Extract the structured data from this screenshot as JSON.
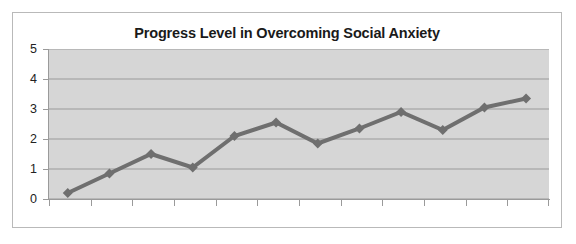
{
  "chart_data": {
    "type": "line",
    "title": "Progress Level in Overcoming Social Anxiety",
    "xlabel": "",
    "ylabel": "",
    "ylim": [
      0,
      5
    ],
    "yticks": [
      0,
      1,
      2,
      3,
      4,
      5
    ],
    "ytick_labels": [
      "0",
      "1",
      "2",
      "3",
      "4",
      "5"
    ],
    "grid": true,
    "grid_axis": "y",
    "legend": false,
    "x": [
      1,
      2,
      3,
      4,
      5,
      6,
      7,
      8,
      9,
      10,
      11,
      12
    ],
    "xtick_labels": [
      "",
      "",
      "",
      "",
      "",
      "",
      "",
      "",
      "",
      "",
      "",
      ""
    ],
    "values": [
      0.2,
      0.85,
      1.5,
      1.05,
      2.1,
      2.55,
      1.85,
      2.35,
      2.9,
      2.3,
      3.05,
      3.35
    ],
    "series": [
      {
        "name": "Progress Level",
        "values": [
          0.2,
          0.85,
          1.5,
          1.05,
          2.1,
          2.55,
          1.85,
          2.35,
          2.9,
          2.3,
          3.05,
          3.35
        ]
      }
    ],
    "marker": "diamond",
    "line_color": "#6f6f6f",
    "marker_color": "#6f6f6f",
    "plot_background": "#d6d6d6",
    "gridline_color": "#9a9a9a",
    "axis_color": "#9a9a9a",
    "frame_color": "#b9b9b9",
    "title_color": "#1a1a1a"
  }
}
